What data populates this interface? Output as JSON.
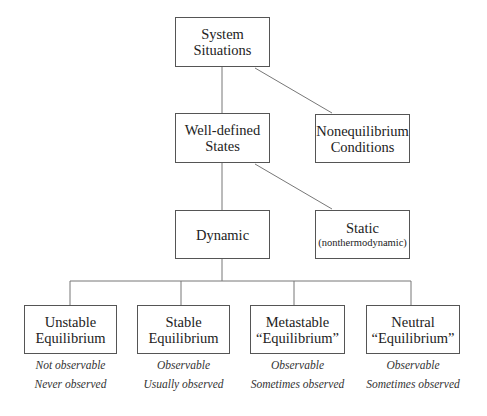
{
  "diagram": {
    "nodes": {
      "root": {
        "line1": "System",
        "line2": "Situations"
      },
      "well_defined": {
        "line1": "Well-defined",
        "line2": "States"
      },
      "nonequilibrium": {
        "line1": "Nonequilibrium",
        "line2": "Conditions"
      },
      "dynamic": {
        "line1": "Dynamic"
      },
      "static": {
        "line1": "Static",
        "line2": "(nonthermodynamic)"
      },
      "unstable": {
        "line1": "Unstable",
        "line2": "Equilibrium",
        "note1": "Not observable",
        "note2": "Never observed"
      },
      "stable": {
        "line1": "Stable",
        "line2": "Equilibrium",
        "note1": "Observable",
        "note2": "Usually observed"
      },
      "metastable": {
        "line1": "Metastable",
        "line2": "“Equilibrium”",
        "note1": "Observable",
        "note2": "Sometimes observed"
      },
      "neutral": {
        "line1": "Neutral",
        "line2": "“Equilibrium”",
        "note1": "Observable",
        "note2": "Sometimes observed"
      }
    },
    "edges": [
      [
        "root",
        "well_defined"
      ],
      [
        "root",
        "nonequilibrium"
      ],
      [
        "well_defined",
        "dynamic"
      ],
      [
        "well_defined",
        "static"
      ],
      [
        "dynamic",
        "unstable"
      ],
      [
        "dynamic",
        "stable"
      ],
      [
        "dynamic",
        "metastable"
      ],
      [
        "dynamic",
        "neutral"
      ]
    ]
  }
}
